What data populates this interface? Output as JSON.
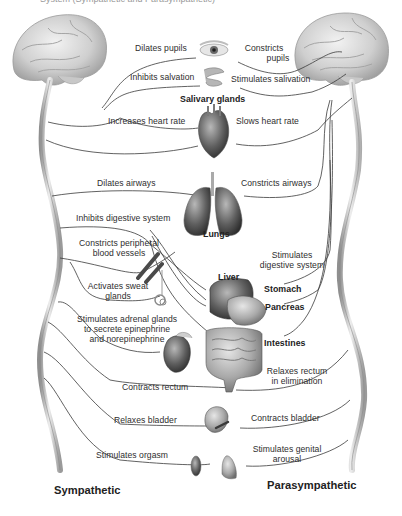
{
  "diagram": {
    "top_caption_partial": "System (Sympathetic and Parasympathetic)",
    "sides": {
      "left": "Sympathetic",
      "right": "Parasympathetic"
    },
    "organs": {
      "eye": "eye",
      "salivary": "Salivary glands",
      "heart": "heart",
      "lungs": "Lungs",
      "liver": "Liver",
      "stomach": "Stomach",
      "pancreas": "Pancreas",
      "intestines": "Intestines",
      "blood_vessel": "blood vessel",
      "sweat_gland": "sweat gland",
      "adrenal": "adrenal gland / kidney",
      "rectum": "rectum",
      "bladder": "bladder",
      "genitals": "genitals"
    },
    "sympathetic_effects": [
      "Dilates pupils",
      "Inhibits salvation",
      "Increases heart rate",
      "Dilates airways",
      "Inhibits digestive system",
      "Constricts peripheral",
      "blood vessels",
      "Activates sweat",
      "glands",
      "Stimulates adrenal glands",
      "to secrete epinephrine",
      "and norepinephrine",
      "Contracts rectum",
      "Relaxes bladder",
      "Stimulates orgasm"
    ],
    "parasympathetic_effects": [
      "Constricts",
      "pupils",
      "Stimulates salivation",
      "Slows heart rate",
      "Constricts airways",
      "Stimulates",
      "digestive system",
      "Relaxes rectum",
      "in elimination",
      "Contracts bladder",
      "Stimulates genital",
      "arousal"
    ],
    "colors": {
      "line": "#3a3a3a",
      "spine": "#bdbdbd",
      "brain": "#d4d4d4",
      "organ_dark": "#5a5a5a",
      "text": "#2e2e2e"
    }
  }
}
